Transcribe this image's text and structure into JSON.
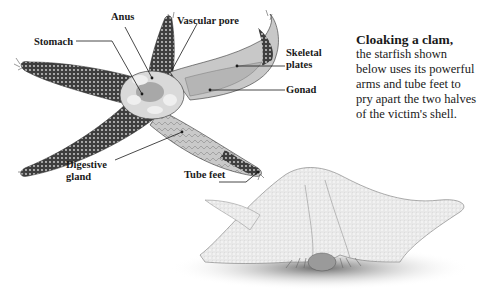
{
  "diagram": {
    "labels": {
      "anus": "Anus",
      "vascular_pore": "Vascular pore",
      "stomach": "Stomach",
      "skeletal_plates_line1": "Skeletal",
      "skeletal_plates_line2": "plates",
      "gonad": "Gonad",
      "digestive_gland_line1": "Digestive",
      "digestive_gland_line2": "gland",
      "tube_feet": "Tube feet"
    },
    "colors": {
      "arm_dark": "#4a4a4a",
      "arm_spots": "#d8d8d8",
      "interior": "#cfcfcf",
      "clam_starfish": "#e6e6e6",
      "shadow": "#8a8a8a",
      "ink": "#1a1a1a"
    }
  },
  "caption": {
    "title": "Cloaking a clam,",
    "body": "the starfish shown below uses its powerful arms and tube feet to pry apart the two halves of the victim's shell."
  }
}
